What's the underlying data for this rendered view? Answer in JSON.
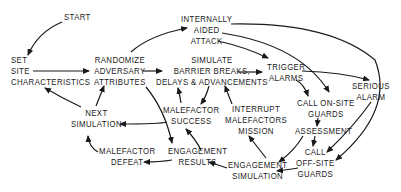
{
  "diagram": {
    "type": "flowchart",
    "ink_color": "#1a1a1a",
    "background": "#ffffff",
    "nodes": {
      "start": {
        "lines": [
          "START"
        ]
      },
      "set_site": {
        "lines": [
          "SET",
          "SITE",
          "CHARACTERISTICS"
        ]
      },
      "randomize": {
        "lines": [
          "RANDOMIZE",
          "ADVERSARY",
          "ATTRIBUTES"
        ]
      },
      "internally_aided": {
        "lines": [
          "INTERNALLY",
          "AIDED",
          "ATTACK"
        ]
      },
      "simulate": {
        "lines": [
          "SIMULATE",
          "BARRIER BREAKS,",
          "DELAYS & ADVANCEMENTS"
        ]
      },
      "trigger": {
        "lines": [
          "TRIGGER",
          "ALARMS"
        ]
      },
      "serious": {
        "lines": [
          "SERIOUS",
          "ALARM"
        ]
      },
      "call_onsite": {
        "lines": [
          "CALL  ON-SITE",
          "GUARDS"
        ]
      },
      "assessment": {
        "lines": [
          "ASSESSMENT"
        ]
      },
      "call_offsite": {
        "lines": [
          "CALL",
          "OFF-SITE",
          "GUARDS"
        ]
      },
      "mal_success": {
        "lines": [
          "MALEFACTOR",
          "SUCCESS"
        ]
      },
      "interrupt": {
        "lines": [
          "INTERRUPT",
          "MALEFACTORS",
          "MISSION"
        ]
      },
      "next_sim": {
        "lines": [
          "NEXT",
          "SIMULATION"
        ]
      },
      "mal_defeat": {
        "lines": [
          "MALEFACTOR",
          "DEFEAT"
        ]
      },
      "eng_results": {
        "lines": [
          "ENGAGEMENT",
          "RESULTS"
        ]
      },
      "eng_sim": {
        "lines": [
          "ENGAGEMENT",
          "SIMULATION"
        ]
      }
    },
    "edges": [
      {
        "from": "START",
        "to": "SET SITE CHARACTERISTICS"
      },
      {
        "from": "SET SITE CHARACTERISTICS",
        "to": "RANDOMIZE ADVERSARY ATTRIBUTES"
      },
      {
        "from": "RANDOMIZE ADVERSARY ATTRIBUTES",
        "to": "INTERNALLY AIDED ATTACK"
      },
      {
        "from": "RANDOMIZE ADVERSARY ATTRIBUTES",
        "to": "SIMULATE BARRIER BREAKS, DELAYS & ADVANCEMENTS"
      },
      {
        "from": "RANDOMIZE ADVERSARY ATTRIBUTES",
        "to": "ENGAGEMENT RESULTS"
      },
      {
        "from": "INTERNALLY AIDED ATTACK",
        "to": "TRIGGER ALARMS"
      },
      {
        "from": "INTERNALLY AIDED ATTACK",
        "to": "CALL ON-SITE GUARDS"
      },
      {
        "from": "INTERNALLY AIDED ATTACK",
        "to": "CALL OFF-SITE GUARDS"
      },
      {
        "from": "SIMULATE BARRIER BREAKS, DELAYS & ADVANCEMENTS",
        "to": "TRIGGER ALARMS"
      },
      {
        "from": "SIMULATE BARRIER BREAKS, DELAYS & ADVANCEMENTS",
        "to": "MALEFACTOR SUCCESS"
      },
      {
        "from": "MALEFACTOR SUCCESS",
        "to": "SIMULATE BARRIER BREAKS, DELAYS & ADVANCEMENTS"
      },
      {
        "from": "TRIGGER ALARMS",
        "to": "CALL ON-SITE GUARDS"
      },
      {
        "from": "TRIGGER ALARMS",
        "to": "SERIOUS ALARM"
      },
      {
        "from": "SERIOUS ALARM",
        "to": "CALL OFF-SITE GUARDS"
      },
      {
        "from": "CALL ON-SITE GUARDS",
        "to": "ASSESSMENT"
      },
      {
        "from": "ASSESSMENT",
        "to": "CALL OFF-SITE GUARDS"
      },
      {
        "from": "ASSESSMENT",
        "to": "ENGAGEMENT SIMULATION"
      },
      {
        "from": "CALL OFF-SITE GUARDS",
        "to": "ENGAGEMENT SIMULATION"
      },
      {
        "from": "ENGAGEMENT SIMULATION",
        "to": "INTERRUPT MALEFACTORS MISSION"
      },
      {
        "from": "INTERRUPT MALEFACTORS MISSION",
        "to": "SIMULATE BARRIER BREAKS, DELAYS & ADVANCEMENTS"
      },
      {
        "from": "ENGAGEMENT SIMULATION",
        "to": "ENGAGEMENT RESULTS"
      },
      {
        "from": "ENGAGEMENT RESULTS",
        "to": "MALEFACTOR SUCCESS"
      },
      {
        "from": "ENGAGEMENT RESULTS",
        "to": "MALEFACTOR DEFEAT"
      },
      {
        "from": "MALEFACTOR SUCCESS",
        "to": "NEXT SIMULATION"
      },
      {
        "from": "MALEFACTOR DEFEAT",
        "to": "NEXT SIMULATION"
      },
      {
        "from": "NEXT SIMULATION",
        "to": "SET SITE CHARACTERISTICS"
      },
      {
        "from": "NEXT SIMULATION",
        "to": "RANDOMIZE ADVERSARY ATTRIBUTES"
      }
    ]
  }
}
